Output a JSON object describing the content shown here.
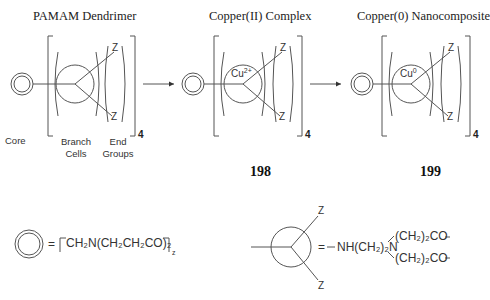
{
  "panels": [
    {
      "title": "PAMAM Dendrimer",
      "center_label": "",
      "number": ""
    },
    {
      "title": "Copper(II) Complex",
      "center_label": "Cu",
      "center_sup": "2+",
      "number": "198"
    },
    {
      "title": "Copper(0) Nanocomposite",
      "center_label": "Cu",
      "center_sup": "0",
      "number": "199"
    }
  ],
  "labels": {
    "core": "Core",
    "branch_cells": [
      "Branch",
      "Cells"
    ],
    "end_groups": [
      "End",
      "Groups"
    ],
    "end_group_symbol": "Z",
    "generation_subscript": "4"
  },
  "legend": {
    "core_formula": {
      "equals": "=",
      "text": "CH₂N(CH₂CH₂CO)₂",
      "subscript": "z"
    },
    "branch_formula": {
      "equals": "=",
      "text": "NH(CH₂)₂N",
      "arm_top": "(CH₂)₂CO",
      "arm_bottom": "(CH₂)₂CO",
      "z_top": "Z",
      "z_bottom": "Z"
    }
  },
  "colors": {
    "line": "#555555",
    "text": "#333333",
    "background": "#ffffff"
  }
}
